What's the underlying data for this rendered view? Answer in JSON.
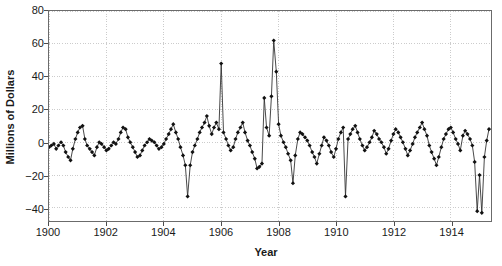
{
  "chart_data": {
    "type": "line",
    "title": "",
    "subtitle": "",
    "xlabel": "Year",
    "ylabel": "Millions of Dollars",
    "xlim": [
      1900.0,
      1915.4
    ],
    "ylim": [
      -48,
      80
    ],
    "grid": true,
    "legend": null,
    "marker": "diamond",
    "line_color": "#333333",
    "marker_color": "#111111",
    "grid_color": "#cccccc",
    "axis_color": "#6b6b6b",
    "yticks": [
      80,
      60,
      40,
      20,
      0,
      -20,
      -40
    ],
    "ytick_labels": [
      "80",
      "60",
      "40",
      "20",
      "0",
      "−20",
      "−40"
    ],
    "xticks": [
      1900,
      1902,
      1904,
      1906,
      1908,
      1910,
      1912,
      1914
    ],
    "xtick_labels": [
      "1900",
      "1902",
      "1904",
      "1906",
      "1908",
      "1910",
      "1912",
      "1914"
    ],
    "x": [
      1900.0,
      1900.08,
      1900.17,
      1900.25,
      1900.33,
      1900.42,
      1900.5,
      1900.58,
      1900.67,
      1900.75,
      1900.83,
      1900.92,
      1901.0,
      1901.08,
      1901.17,
      1901.25,
      1901.33,
      1901.42,
      1901.5,
      1901.58,
      1901.67,
      1901.75,
      1901.83,
      1901.92,
      1902.0,
      1902.08,
      1902.17,
      1902.25,
      1902.33,
      1902.42,
      1902.5,
      1902.58,
      1902.67,
      1902.75,
      1902.83,
      1902.92,
      1903.0,
      1903.08,
      1903.17,
      1903.25,
      1903.33,
      1903.42,
      1903.5,
      1903.58,
      1903.67,
      1903.75,
      1903.83,
      1903.92,
      1904.0,
      1904.08,
      1904.17,
      1904.25,
      1904.33,
      1904.42,
      1904.5,
      1904.58,
      1904.67,
      1904.75,
      1904.83,
      1904.92,
      1905.0,
      1905.08,
      1905.17,
      1905.25,
      1905.33,
      1905.42,
      1905.5,
      1905.58,
      1905.67,
      1905.75,
      1905.83,
      1905.92,
      1906.0,
      1906.08,
      1906.17,
      1906.25,
      1906.33,
      1906.42,
      1906.5,
      1906.58,
      1906.67,
      1906.75,
      1906.83,
      1906.92,
      1907.0,
      1907.08,
      1907.17,
      1907.25,
      1907.33,
      1907.42,
      1907.5,
      1907.58,
      1907.67,
      1907.75,
      1907.83,
      1907.92,
      1908.0,
      1908.08,
      1908.17,
      1908.25,
      1908.33,
      1908.42,
      1908.5,
      1908.58,
      1908.67,
      1908.75,
      1908.83,
      1908.92,
      1909.0,
      1909.08,
      1909.17,
      1909.25,
      1909.33,
      1909.42,
      1909.5,
      1909.58,
      1909.67,
      1909.75,
      1909.83,
      1909.92,
      1910.0,
      1910.08,
      1910.17,
      1910.25,
      1910.33,
      1910.42,
      1910.5,
      1910.58,
      1910.67,
      1910.75,
      1910.83,
      1910.92,
      1911.0,
      1911.08,
      1911.17,
      1911.25,
      1911.33,
      1911.42,
      1911.5,
      1911.58,
      1911.67,
      1911.75,
      1911.83,
      1911.92,
      1912.0,
      1912.08,
      1912.17,
      1912.25,
      1912.33,
      1912.42,
      1912.5,
      1912.58,
      1912.67,
      1912.75,
      1912.83,
      1912.92,
      1913.0,
      1913.08,
      1913.17,
      1913.25,
      1913.33,
      1913.42,
      1913.5,
      1913.58,
      1913.67,
      1913.75,
      1913.83,
      1913.92,
      1914.0,
      1914.08,
      1914.17,
      1914.25,
      1914.33,
      1914.42,
      1914.5,
      1914.58,
      1914.67,
      1914.75,
      1914.83,
      1914.92,
      1915.0,
      1915.08,
      1915.17,
      1915.25,
      1915.33
    ],
    "values": [
      -3,
      -2,
      -1,
      -4,
      -2,
      0,
      -2,
      -6,
      -9,
      -11,
      -4,
      2,
      6,
      9,
      10,
      2,
      -2,
      -4,
      -6,
      -8,
      -3,
      0,
      -1,
      -3,
      -5,
      -4,
      -2,
      0,
      -1,
      2,
      6,
      9,
      8,
      3,
      0,
      -3,
      -6,
      -9,
      -8,
      -5,
      -2,
      0,
      2,
      1,
      0,
      -2,
      -4,
      -3,
      -1,
      2,
      5,
      8,
      11,
      6,
      2,
      -3,
      -8,
      -14,
      -33,
      -14,
      -6,
      -2,
      2,
      6,
      9,
      12,
      16,
      10,
      5,
      9,
      12,
      8,
      48,
      6,
      2,
      -2,
      -5,
      -3,
      2,
      6,
      9,
      12,
      6,
      1,
      -2,
      -6,
      -10,
      -16,
      -15,
      -13,
      27,
      9,
      4,
      28,
      62,
      43,
      11,
      4,
      0,
      -3,
      -7,
      -11,
      -25,
      -8,
      2,
      6,
      5,
      3,
      1,
      -2,
      -6,
      -9,
      -13,
      -7,
      -2,
      3,
      1,
      -2,
      -6,
      -9,
      -4,
      2,
      6,
      9,
      -33,
      2,
      5,
      8,
      10,
      6,
      2,
      -2,
      -5,
      -3,
      0,
      3,
      7,
      5,
      2,
      0,
      -3,
      -7,
      -4,
      1,
      5,
      8,
      6,
      3,
      0,
      -4,
      -8,
      -5,
      -1,
      3,
      6,
      9,
      12,
      8,
      4,
      -2,
      -6,
      -10,
      -14,
      -9,
      -3,
      2,
      5,
      8,
      9,
      6,
      2,
      -1,
      -5,
      4,
      7,
      5,
      2,
      -2,
      -12,
      -42,
      -20,
      -43,
      -9,
      1,
      8
    ],
    "notable_points": [
      {
        "x": 1904.83,
        "y": -33,
        "note": "trough"
      },
      {
        "x": 1906.0,
        "y": 48,
        "note": "spike"
      },
      {
        "x": 1907.83,
        "y": 62,
        "note": "peak"
      },
      {
        "x": 1910.33,
        "y": -33,
        "note": "trough"
      },
      {
        "x": 1915.08,
        "y": -43,
        "note": "trough"
      }
    ]
  }
}
